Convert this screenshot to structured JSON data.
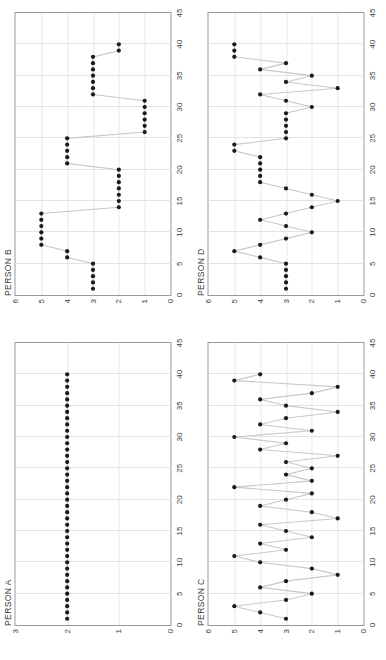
{
  "figure": {
    "orientation": "landscape-rotated",
    "panel_count": 4,
    "dot_color": "#1a1a1a",
    "line_color": "#c9c9c9",
    "grid_color": "#e2e2e2",
    "axis_color": "#9a9a9a"
  },
  "chart_data": [
    {
      "type": "line",
      "panel": "bottom-left",
      "title": "PERSON A",
      "xlabel": "",
      "ylabel": "",
      "xlim": [
        0,
        45
      ],
      "ylim": [
        0,
        3
      ],
      "xticks": [
        0,
        5,
        10,
        15,
        20,
        25,
        30,
        35,
        40,
        45
      ],
      "yticks": [
        0,
        1,
        2,
        3
      ],
      "grid": true,
      "legend": "none",
      "x": [
        1,
        2,
        3,
        4,
        5,
        6,
        7,
        8,
        9,
        10,
        11,
        12,
        13,
        14,
        15,
        16,
        17,
        18,
        19,
        20,
        21,
        22,
        23,
        24,
        25,
        26,
        27,
        28,
        29,
        30,
        31,
        32,
        33,
        34,
        35,
        36,
        37,
        38,
        39,
        40
      ],
      "values": [
        2,
        2,
        2,
        2,
        2,
        2,
        2,
        2,
        2,
        2,
        2,
        2,
        2,
        2,
        2,
        2,
        2,
        2,
        2,
        2,
        2,
        2,
        2,
        2,
        2,
        2,
        2,
        2,
        2,
        2,
        2,
        2,
        2,
        2,
        2,
        2,
        2,
        2,
        2,
        2
      ]
    },
    {
      "type": "line",
      "panel": "top-left",
      "title": "PERSON B",
      "xlabel": "",
      "ylabel": "",
      "xlim": [
        0,
        45
      ],
      "ylim": [
        0,
        6
      ],
      "xticks": [
        0,
        5,
        10,
        15,
        20,
        25,
        30,
        35,
        40,
        45
      ],
      "yticks": [
        0,
        1,
        2,
        3,
        4,
        5,
        6
      ],
      "grid": true,
      "legend": "none",
      "x": [
        1,
        2,
        3,
        4,
        5,
        6,
        7,
        8,
        9,
        10,
        11,
        12,
        13,
        14,
        15,
        16,
        17,
        18,
        19,
        20,
        21,
        22,
        23,
        24,
        25,
        26,
        27,
        28,
        29,
        30,
        31,
        32,
        33,
        34,
        35,
        36,
        37,
        38,
        39,
        40
      ],
      "values": [
        3,
        3,
        3,
        3,
        3,
        4,
        4,
        5,
        5,
        5,
        5,
        5,
        5,
        2,
        2,
        2,
        2,
        2,
        2,
        2,
        4,
        4,
        4,
        4,
        4,
        1,
        1,
        1,
        1,
        1,
        1,
        3,
        3,
        3,
        3,
        3,
        3,
        3,
        2,
        2
      ]
    },
    {
      "type": "line",
      "panel": "bottom-right",
      "title": "PERSON C",
      "xlabel": "",
      "ylabel": "",
      "xlim": [
        0,
        45
      ],
      "ylim": [
        0,
        6
      ],
      "xticks": [
        0,
        5,
        10,
        15,
        20,
        25,
        30,
        35,
        40,
        45
      ],
      "yticks": [
        0,
        1,
        2,
        3,
        4,
        5,
        6
      ],
      "grid": true,
      "legend": "none",
      "x": [
        1,
        2,
        3,
        4,
        5,
        6,
        7,
        8,
        9,
        10,
        11,
        12,
        13,
        14,
        15,
        16,
        17,
        18,
        19,
        20,
        21,
        22,
        23,
        24,
        25,
        26,
        27,
        28,
        29,
        30,
        31,
        32,
        33,
        34,
        35,
        36,
        37,
        38,
        39,
        40
      ],
      "values": [
        3,
        4,
        5,
        3,
        2,
        4,
        3,
        1,
        2,
        4,
        5,
        3,
        4,
        2,
        3,
        4,
        1,
        2,
        4,
        3,
        2,
        5,
        2,
        3,
        2,
        3,
        1,
        4,
        3,
        5,
        2,
        4,
        3,
        1,
        3,
        4,
        2,
        1,
        5,
        4
      ]
    },
    {
      "type": "line",
      "panel": "top-right",
      "title": "PERSON D",
      "xlabel": "",
      "ylabel": "",
      "xlim": [
        0,
        45
      ],
      "ylim": [
        0,
        6
      ],
      "xticks": [
        0,
        5,
        10,
        15,
        20,
        25,
        30,
        35,
        40,
        45
      ],
      "yticks": [
        0,
        1,
        2,
        3,
        4,
        5,
        6
      ],
      "grid": true,
      "legend": "none",
      "x": [
        1,
        2,
        3,
        4,
        5,
        6,
        7,
        8,
        9,
        10,
        11,
        12,
        13,
        14,
        15,
        16,
        17,
        18,
        19,
        20,
        21,
        22,
        23,
        24,
        25,
        26,
        27,
        28,
        29,
        30,
        31,
        32,
        33,
        34,
        35,
        36,
        37,
        38,
        39,
        40
      ],
      "values": [
        3,
        3,
        3,
        3,
        3,
        4,
        5,
        4,
        3,
        2,
        3,
        4,
        3,
        2,
        1,
        2,
        3,
        4,
        4,
        4,
        4,
        4,
        5,
        5,
        3,
        3,
        3,
        3,
        3,
        2,
        3,
        4,
        1,
        3,
        2,
        4,
        3,
        5,
        5,
        5
      ]
    }
  ]
}
